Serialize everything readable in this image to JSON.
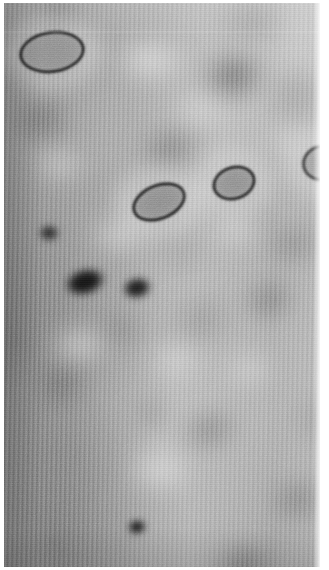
{
  "image": {
    "kind": "scanning-probe-micrograph",
    "modality": "grayscale",
    "width_px": 329,
    "height_px": 570,
    "background_tone": "#a6a6a6",
    "description": "Grayscale scanning-probe style micrograph showing a quasi-periodic field of diffuse dark lobes overlaid by fine vertical scan striping, with several sharply dark-outlined elliptical ring defects and solid dark elliptical spots.",
    "border": {
      "color": "#ffffff",
      "left_px": 4,
      "top_px": 3,
      "right_px": 9,
      "bottom_px": 3
    },
    "texture": {
      "vertical_stripe_period_px": 4.7,
      "vertical_stripe_tilt_deg": 1,
      "horizontal_raster_period_px": 2,
      "grain": "fine"
    },
    "tones": {
      "darkest": "#1a1a1a",
      "dark": "#5a5a5a",
      "mid": "#a6a6a6",
      "light": "#d8d8d8",
      "brightest": "#f2f2f2"
    }
  },
  "features": {
    "ring_defects": [
      {
        "id": "ring-top-left",
        "cx": 52,
        "cy": 52,
        "rx": 33,
        "ry": 21,
        "rot": -8,
        "stroke": "#1f1f1f",
        "stroke_px": 3.2,
        "fill": "#8e8e8e"
      },
      {
        "id": "ring-center-left",
        "cx": 159,
        "cy": 202,
        "rx": 28,
        "ry": 18,
        "rot": -22,
        "stroke": "#232323",
        "stroke_px": 3.0,
        "fill": "#8a8a8a"
      },
      {
        "id": "ring-center-right",
        "cx": 234,
        "cy": 183,
        "rx": 22,
        "ry": 17,
        "rot": -18,
        "stroke": "#242424",
        "stroke_px": 3.0,
        "fill": "#8c8c8c"
      },
      {
        "id": "ring-right-edge",
        "cx": 322,
        "cy": 163,
        "rx": 20,
        "ry": 18,
        "rot": -12,
        "stroke": "#262626",
        "stroke_px": 3.0,
        "fill": "#8f8f8f"
      }
    ],
    "dark_spots": [
      {
        "id": "spot-mid-left",
        "cx": 85,
        "cy": 282,
        "rx": 23,
        "ry": 15,
        "rot": -16,
        "color": "#151515"
      },
      {
        "id": "spot-upper-left",
        "cx": 49,
        "cy": 233,
        "rx": 11,
        "ry": 9,
        "rot": 0,
        "color": "#2d2d2d"
      },
      {
        "id": "spot-top-strip",
        "cx": 137,
        "cy": 288,
        "rx": 16,
        "ry": 12,
        "rot": -12,
        "color": "#1e1e1e"
      },
      {
        "id": "spot-bottom-center",
        "cx": 137,
        "cy": 527,
        "rx": 10,
        "ry": 8,
        "rot": -10,
        "color": "#141414"
      }
    ],
    "diffuse_lobes": [
      {
        "cx": 55,
        "cy": 10,
        "rx": 26,
        "ry": 16,
        "rot": 0,
        "color": "#4a4a4a",
        "blur": "soft"
      },
      {
        "cx": 250,
        "cy": 20,
        "rx": 34,
        "ry": 18,
        "rot": -4,
        "color": "#6b6b6b",
        "blur": "vsoft"
      },
      {
        "cx": 234,
        "cy": 76,
        "rx": 34,
        "ry": 26,
        "rot": -10,
        "color": "#555555",
        "blur": "soft"
      },
      {
        "cx": 40,
        "cy": 120,
        "rx": 30,
        "ry": 22,
        "rot": -14,
        "color": "#5e5e5e",
        "blur": "soft"
      },
      {
        "cx": 170,
        "cy": 148,
        "rx": 32,
        "ry": 19,
        "rot": -12,
        "color": "#6a6a6a",
        "blur": "soft"
      },
      {
        "cx": 300,
        "cy": 95,
        "rx": 28,
        "ry": 22,
        "rot": 0,
        "color": "#6f6f6f",
        "blur": "vsoft"
      },
      {
        "cx": 296,
        "cy": 245,
        "rx": 30,
        "ry": 19,
        "rot": -10,
        "color": "#6d6d6d",
        "blur": "soft"
      },
      {
        "cx": 270,
        "cy": 300,
        "rx": 28,
        "ry": 18,
        "rot": -12,
        "color": "#646464",
        "blur": "soft"
      },
      {
        "cx": 200,
        "cy": 320,
        "rx": 34,
        "ry": 20,
        "rot": -14,
        "color": "#737373",
        "blur": "vsoft"
      },
      {
        "cx": 120,
        "cy": 330,
        "rx": 26,
        "ry": 16,
        "rot": -10,
        "color": "#767676",
        "blur": "soft"
      },
      {
        "cx": 60,
        "cy": 385,
        "rx": 28,
        "ry": 20,
        "rot": -8,
        "color": "#5f5f5f",
        "blur": "soft"
      },
      {
        "cx": 210,
        "cy": 430,
        "rx": 30,
        "ry": 17,
        "rot": -14,
        "color": "#6a6a6a",
        "blur": "soft"
      },
      {
        "cx": 320,
        "cy": 420,
        "rx": 26,
        "ry": 20,
        "rot": 0,
        "color": "#6e6e6e",
        "blur": "vsoft"
      },
      {
        "cx": 300,
        "cy": 500,
        "rx": 30,
        "ry": 22,
        "rot": -10,
        "color": "#636363",
        "blur": "soft"
      },
      {
        "cx": 245,
        "cy": 565,
        "rx": 30,
        "ry": 20,
        "rot": -10,
        "color": "#5d5d5d",
        "blur": "soft"
      },
      {
        "cx": 60,
        "cy": 455,
        "rx": 24,
        "ry": 18,
        "rot": -8,
        "color": "#7a7a7a",
        "blur": "vsoft"
      },
      {
        "cx": 150,
        "cy": 415,
        "rx": 22,
        "ry": 14,
        "rot": -10,
        "color": "#7d7d7d",
        "blur": "soft"
      },
      {
        "cx": 100,
        "cy": 190,
        "rx": 24,
        "ry": 15,
        "rot": -12,
        "color": "#8a8a8a",
        "blur": "vsoft"
      },
      {
        "cx": 30,
        "cy": 300,
        "rx": 22,
        "ry": 18,
        "rot": 0,
        "color": "#7c7c7c",
        "blur": "vsoft"
      },
      {
        "cx": 185,
        "cy": 255,
        "rx": 24,
        "ry": 15,
        "rot": -12,
        "color": "#858585",
        "blur": "vsoft"
      }
    ],
    "bright_halos": [
      {
        "cx": 150,
        "cy": 60,
        "rx": 40,
        "ry": 24,
        "color": "#ededed"
      },
      {
        "cx": 120,
        "cy": 235,
        "rx": 34,
        "ry": 20,
        "color": "#e4e4e4"
      },
      {
        "cx": 236,
        "cy": 230,
        "rx": 30,
        "ry": 18,
        "color": "#e0e0e0"
      },
      {
        "cx": 80,
        "cy": 345,
        "rx": 34,
        "ry": 20,
        "color": "#e8e8e8"
      },
      {
        "cx": 175,
        "cy": 360,
        "rx": 30,
        "ry": 18,
        "color": "#dedede"
      },
      {
        "cx": 250,
        "cy": 370,
        "rx": 28,
        "ry": 18,
        "color": "#dcdcdc"
      },
      {
        "cx": 160,
        "cy": 470,
        "rx": 36,
        "ry": 22,
        "color": "#e6e6e6"
      },
      {
        "cx": 60,
        "cy": 165,
        "rx": 28,
        "ry": 18,
        "color": "#dcdcdc"
      },
      {
        "cx": 285,
        "cy": 140,
        "rx": 26,
        "ry": 16,
        "color": "#d6d6d6"
      },
      {
        "cx": 200,
        "cy": 110,
        "rx": 30,
        "ry": 18,
        "color": "#e2e2e2"
      }
    ],
    "scan_artifacts": [
      {
        "id": "scanline-top",
        "y": 31,
        "height": 2,
        "opacity": 0.3
      }
    ]
  }
}
